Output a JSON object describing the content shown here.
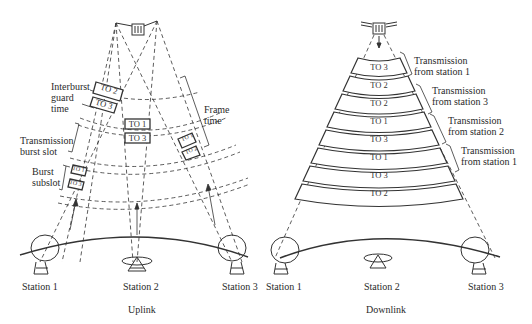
{
  "uplink": {
    "caption": "Uplink",
    "stations": [
      {
        "label": "Station 1"
      },
      {
        "label": "Station 2"
      },
      {
        "label": "Station 3"
      }
    ],
    "annotations": {
      "interburst": "Interburst\nguard\ntime",
      "interburst_l1": "Interburst",
      "interburst_l2": "guard",
      "interburst_l3": "time",
      "burst_slot_l1": "Transmission",
      "burst_slot_l2": "burst slot",
      "subslot_l1": "Burst",
      "subslot_l2": "subslot",
      "frame_l1": "Frame",
      "frame_l2": "time"
    },
    "bursts": {
      "station1_top": [
        "TO 2",
        "TO 3"
      ],
      "station2": [
        "TO 1",
        "TO 3"
      ],
      "station3": [
        "TO 1",
        "TO 2"
      ],
      "station1_bottom": [
        "TO 1",
        "TO 3"
      ]
    }
  },
  "downlink": {
    "caption": "Downlink",
    "stations": [
      {
        "label": "Station 1"
      },
      {
        "label": "Station 2"
      },
      {
        "label": "Station 3"
      }
    ],
    "bands": [
      "TO 3",
      "TO 2",
      "TO 2",
      "TO 1",
      "TO 3",
      "TO 1",
      "TO 3",
      "TO 2"
    ],
    "transmissions": [
      {
        "l1": "Transmission",
        "l2": "from station 1"
      },
      {
        "l1": "Transmission",
        "l2": "from station 3"
      },
      {
        "l1": "Transmission",
        "l2": "from station 2"
      },
      {
        "l1": "Transmission",
        "l2": "from station 1"
      }
    ]
  }
}
